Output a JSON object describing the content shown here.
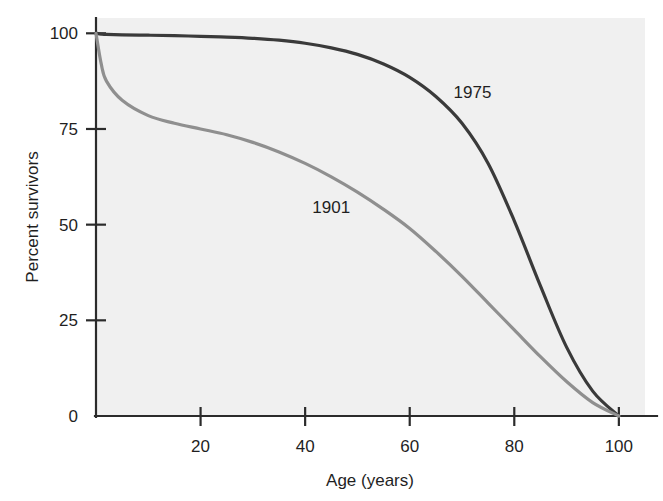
{
  "chart_data": {
    "type": "line",
    "title": "",
    "xlabel": "Age (years)",
    "ylabel": "Percent survivors",
    "xlim": [
      0,
      105
    ],
    "ylim": [
      0,
      104
    ],
    "grid": false,
    "legend_position": "inline-annotation",
    "xticks": [
      {
        "value": 0,
        "label": "0"
      },
      {
        "value": 20,
        "label": "20"
      },
      {
        "value": 40,
        "label": "40"
      },
      {
        "value": 60,
        "label": "60"
      },
      {
        "value": 80,
        "label": "80"
      },
      {
        "value": 100,
        "label": "100"
      }
    ],
    "yticks": [
      {
        "value": 0,
        "label": "0"
      },
      {
        "value": 25,
        "label": "25"
      },
      {
        "value": 50,
        "label": "50"
      },
      {
        "value": 75,
        "label": "75"
      },
      {
        "value": 100,
        "label": "100"
      }
    ],
    "x": [
      0,
      1,
      2,
      5,
      10,
      15,
      20,
      25,
      30,
      35,
      40,
      45,
      50,
      55,
      60,
      65,
      70,
      75,
      80,
      85,
      90,
      95,
      100
    ],
    "series": [
      {
        "name": "1975",
        "label": "1975",
        "color": "#3a3a3a",
        "stroke_width": 3.2,
        "label_x": 72,
        "label_y": 83,
        "values": [
          100,
          99.8,
          99.7,
          99.6,
          99.5,
          99.4,
          99.2,
          99.0,
          98.7,
          98.2,
          97.4,
          96.2,
          94.5,
          92.0,
          88.5,
          83.5,
          76.5,
          66.0,
          51.0,
          34.0,
          18.0,
          6.5,
          0
        ]
      },
      {
        "name": "1901",
        "label": "1901",
        "color": "#8f8f8f",
        "stroke_width": 3.2,
        "label_x": 45,
        "label_y": 53,
        "values": [
          100,
          92.0,
          87.5,
          82.5,
          78.5,
          76.5,
          75.0,
          73.5,
          71.5,
          69.0,
          66.0,
          62.5,
          58.5,
          54.0,
          49.0,
          43.0,
          36.5,
          29.5,
          22.5,
          15.5,
          9.0,
          3.5,
          0
        ]
      }
    ]
  },
  "geometry": {
    "plot_left": 96,
    "plot_right": 645,
    "plot_top": 18,
    "plot_bottom": 416,
    "x_pixels_per_unit": 5.105,
    "y_pixels_per_unit": 3.72
  }
}
